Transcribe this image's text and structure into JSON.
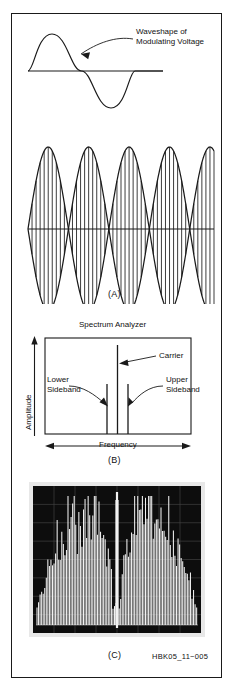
{
  "figure": {
    "credit": "HBK05_11−005",
    "panels": [
      {
        "id": "A",
        "caption": "(A)",
        "annotation": "Waveshape of\nModulating Voltage",
        "description": "Sinusoidal modulating voltage above a 100% amplitude-modulated RF envelope"
      },
      {
        "id": "B",
        "caption": "(B)",
        "title": "Spectrum Analyzer",
        "y_axis_label": "Amplitude",
        "x_axis_label": "Frequency",
        "annotations": {
          "carrier": "Carrier",
          "lower_sideband": "Lower\nSideband",
          "upper_sideband": "Upper\nSideband"
        }
      },
      {
        "id": "C",
        "caption": "(C)",
        "description": "Oscilloscope photograph of spectrum-analyzer display of a modulated signal"
      }
    ]
  },
  "chart_data": [
    {
      "type": "line",
      "title": "Waveshape of Modulating Voltage",
      "xlabel": "",
      "ylabel": "",
      "x": [
        0,
        0.0625,
        0.125,
        0.1875,
        0.25,
        0.3125,
        0.375,
        0.4375,
        0.5,
        0.5625,
        0.625,
        0.6875,
        0.75,
        0.8125,
        0.875,
        0.9375,
        1.0
      ],
      "series": [
        {
          "name": "modulating voltage",
          "values": [
            0,
            0.383,
            0.707,
            0.924,
            1.0,
            0.924,
            0.707,
            0.383,
            0,
            -0.383,
            -0.707,
            -0.924,
            -1.0,
            -0.924,
            -0.707,
            -0.383,
            0
          ]
        }
      ],
      "ylim": [
        -1.15,
        1.15
      ],
      "grid": false,
      "legend": "none"
    },
    {
      "type": "area",
      "title": "100% amplitude modulated RF envelope",
      "xlabel": "",
      "ylabel": "",
      "modulation_index": 1.0,
      "modulation_cycles": 2.3,
      "carrier_cycles": 46,
      "ylim": [
        -1.1,
        1.1
      ],
      "grid": false,
      "legend": "none"
    },
    {
      "type": "bar",
      "title": "Spectrum Analyzer",
      "xlabel": "Frequency",
      "ylabel": "Amplitude",
      "categories": [
        "Lower Sideband",
        "Carrier",
        "Upper Sideband"
      ],
      "values": [
        0.52,
        1.0,
        0.52
      ],
      "ylim": [
        0,
        1.15
      ],
      "grid": false,
      "legend": "none",
      "annotations": [
        "Carrier",
        "Lower Sideband",
        "Upper Sideband"
      ]
    },
    {
      "type": "line",
      "title": "Spectrum analyzer photograph of modulated signal",
      "xlabel": "Frequency",
      "ylabel": "Amplitude",
      "grid": true,
      "grid_divisions_x": 8,
      "grid_divisions_y": 8,
      "legend": "none",
      "features": [
        "central carrier line",
        "upper sideband group",
        "lower sideband group"
      ]
    }
  ],
  "colors": {
    "ink": "#1a1a1a",
    "paper": "#ffffff",
    "scope_background": "#0d0d0d",
    "scope_trace": "#f4f4f4",
    "scope_bezel": "#e8e8e8"
  }
}
